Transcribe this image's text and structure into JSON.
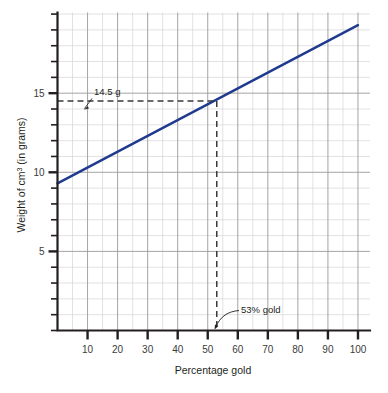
{
  "chart_data": {
    "type": "line",
    "title": "",
    "xlabel": "Percentage gold",
    "ylabel": "Weight of cm3 (in grams)",
    "ylabel_parts": {
      "before": "Weight of cm",
      "superscript": "3",
      "after": " (in grams)"
    },
    "xlim": [
      0,
      104
    ],
    "ylim": [
      0,
      20.1
    ],
    "x_ticks_major": [
      10,
      20,
      30,
      40,
      50,
      60,
      70,
      80,
      90,
      100
    ],
    "x_tick_labels": [
      "10",
      "20",
      "30",
      "40",
      "50",
      "60",
      "70",
      "80",
      "90",
      "100"
    ],
    "x_minor_step": 5,
    "y_ticks_major": [
      5,
      10,
      15
    ],
    "y_tick_labels": [
      "5",
      "10",
      "15"
    ],
    "y_minor_step": 1,
    "grid": "both",
    "legend": "none",
    "series": [
      {
        "name": "Weight of 1 cm3 alloy",
        "color": "#1f3a8f",
        "x": [
          0,
          100
        ],
        "values": [
          9.3,
          19.3
        ],
        "points": [
          {
            "x": 0,
            "y": 9.3
          },
          {
            "x": 10,
            "y": 10.3
          },
          {
            "x": 20,
            "y": 11.3
          },
          {
            "x": 30,
            "y": 12.3
          },
          {
            "x": 40,
            "y": 13.3
          },
          {
            "x": 50,
            "y": 14.3
          },
          {
            "x": 53,
            "y": 14.5
          },
          {
            "x": 60,
            "y": 15.3
          },
          {
            "x": 70,
            "y": 16.3
          },
          {
            "x": 80,
            "y": 17.3
          },
          {
            "x": 90,
            "y": 18.3
          },
          {
            "x": 100,
            "y": 19.3
          }
        ]
      }
    ],
    "annotations": [
      {
        "id": "weight-readout",
        "label": "14.5 g",
        "value": 14.5,
        "axis": "y",
        "guide": "horizontal-dashed"
      },
      {
        "id": "gold-readout",
        "label": "53% gold",
        "value": 53,
        "axis": "x",
        "guide": "vertical-dashed"
      }
    ],
    "colors": {
      "series": "#1f3a8f",
      "axis": "#231f20",
      "grid_minor": "#d6d6d6",
      "grid_major": "#9a9a9a",
      "guide": "#3a3a3a",
      "background": "#ffffff"
    }
  }
}
